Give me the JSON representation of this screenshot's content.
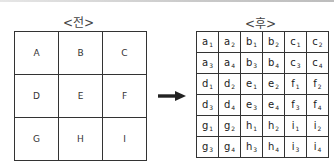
{
  "before": {
    "title": "<전>",
    "cells": [
      [
        "A",
        "B",
        "C"
      ],
      [
        "D",
        "E",
        "F"
      ],
      [
        "G",
        "H",
        "I"
      ]
    ]
  },
  "after": {
    "title": "<후>",
    "cells": [
      [
        {
          "l": "a",
          "s": "1"
        },
        {
          "l": "a",
          "s": "2"
        },
        {
          "l": "b",
          "s": "1"
        },
        {
          "l": "b",
          "s": "2"
        },
        {
          "l": "c",
          "s": "1"
        },
        {
          "l": "c",
          "s": "2"
        }
      ],
      [
        {
          "l": "a",
          "s": "3"
        },
        {
          "l": "a",
          "s": "4"
        },
        {
          "l": "b",
          "s": "3"
        },
        {
          "l": "b",
          "s": "4"
        },
        {
          "l": "c",
          "s": "3"
        },
        {
          "l": "c",
          "s": "4"
        }
      ],
      [
        {
          "l": "d",
          "s": "1"
        },
        {
          "l": "d",
          "s": "2"
        },
        {
          "l": "e",
          "s": "1"
        },
        {
          "l": "e",
          "s": "2"
        },
        {
          "l": "f",
          "s": "1"
        },
        {
          "l": "f",
          "s": "2"
        }
      ],
      [
        {
          "l": "d",
          "s": "3"
        },
        {
          "l": "d",
          "s": "4"
        },
        {
          "l": "e",
          "s": "3"
        },
        {
          "l": "e",
          "s": "4"
        },
        {
          "l": "f",
          "s": "3"
        },
        {
          "l": "f",
          "s": "4"
        }
      ],
      [
        {
          "l": "g",
          "s": "1"
        },
        {
          "l": "g",
          "s": "2"
        },
        {
          "l": "h",
          "s": "1"
        },
        {
          "l": "h",
          "s": "2"
        },
        {
          "l": "i",
          "s": "1"
        },
        {
          "l": "i",
          "s": "2"
        }
      ],
      [
        {
          "l": "g",
          "s": "3"
        },
        {
          "l": "g",
          "s": "4"
        },
        {
          "l": "h",
          "s": "3"
        },
        {
          "l": "h",
          "s": "4"
        },
        {
          "l": "i",
          "s": "3"
        },
        {
          "l": "i",
          "s": "4"
        }
      ]
    ]
  },
  "arrow": {
    "icon": "right-arrow-icon",
    "color": "#222222"
  }
}
